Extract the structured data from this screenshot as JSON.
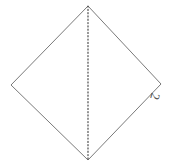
{
  "figure": {
    "canvas": {
      "width": 178,
      "height": 167,
      "background": "#ffffff"
    },
    "shape": {
      "name": "rhombus-outline",
      "kind": "diamond",
      "stroke_color": "#7a7a7a",
      "stroke_width": 1,
      "fill": "none",
      "vertices": {
        "top": {
          "x": 88,
          "y": 6
        },
        "right": {
          "x": 161,
          "y": 84
        },
        "bottom": {
          "x": 88,
          "y": 160
        },
        "left": {
          "x": 11,
          "y": 85
        }
      },
      "path": "M 88 6 L 161 84 L 88 160 L 11 85 Z"
    },
    "fold_line": {
      "name": "vertical-fold-crease",
      "style": "dotted",
      "stroke_color": "#4a4a4a",
      "stroke_width": 1.2,
      "dash_pattern": "1.1 2.2",
      "from": {
        "x": 88,
        "y": 6
      },
      "to": {
        "x": 88,
        "y": 160
      },
      "path": "M 88 6 L 88 160"
    },
    "labels": [
      {
        "id": "label-2",
        "text": "2",
        "color": "#4f4f4f",
        "font_size_px": 13,
        "rotation_deg": 105,
        "x": 152,
        "y": 90,
        "anchor_vertex": "right"
      }
    ]
  }
}
